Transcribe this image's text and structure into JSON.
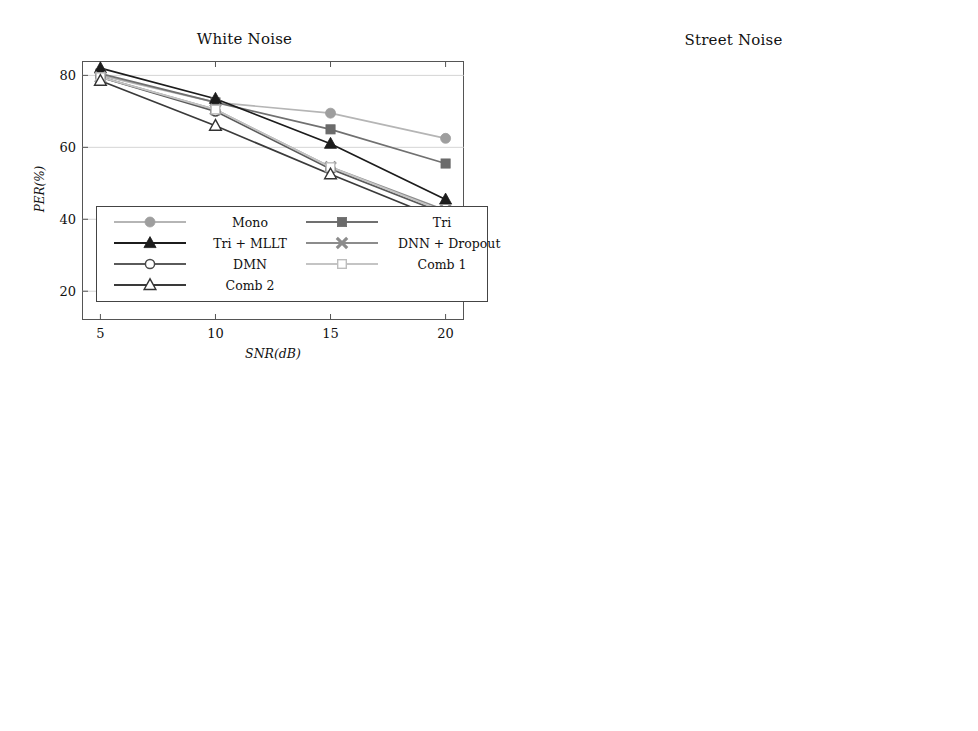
{
  "figure": {
    "xlabel": "SNR(dB)",
    "ylabel": "PER(%)",
    "x_values": [
      5,
      10,
      15,
      20
    ],
    "x_tick_labels": [
      "5",
      "10",
      "15",
      "20"
    ]
  },
  "legend": {
    "entries": [
      {
        "label": "Mono",
        "marker": "filled-circle",
        "color": "#9e9e9e",
        "line_color": "#b5b5b5"
      },
      {
        "label": "Tri",
        "marker": "filled-square",
        "color": "#6b6b6b",
        "line_color": "#707070"
      },
      {
        "label": "Tri + MLLT",
        "marker": "filled-triangle",
        "color": "#1c1c1c",
        "line_color": "#1c1c1c"
      },
      {
        "label": "DNN + Dropout",
        "marker": "cross-x",
        "color": "#8c8c8c",
        "line_color": "#8c8c8c"
      },
      {
        "label": "DMN",
        "marker": "open-circle",
        "color": "#4a4a4a",
        "line_color": "#5a5a5a"
      },
      {
        "label": "Comb 1",
        "marker": "open-square",
        "color": "#bdbdbd",
        "line_color": "#c4c4c4"
      },
      {
        "label": "Comb 2",
        "marker": "open-triangle",
        "color": "#333333",
        "line_color": "#3a3a3a"
      }
    ]
  },
  "chart_data": [
    {
      "type": "line",
      "title": "White Noise",
      "xlabel": "SNR(dB)",
      "ylabel": "PER(%)",
      "x": [
        5,
        10,
        15,
        20
      ],
      "xlim": [
        4.2,
        20.8
      ],
      "ylim": [
        12,
        84
      ],
      "yticks": [
        20,
        40,
        60,
        80
      ],
      "ytick_labels": [
        "20",
        "40",
        "60",
        "80"
      ],
      "grid": true,
      "legend_position": "lower-left-inside",
      "series": [
        {
          "name": "Mono",
          "values": [
            80.0,
            72.5,
            69.5,
            62.5
          ]
        },
        {
          "name": "Tri",
          "values": [
            80.5,
            72.5,
            65.0,
            55.5
          ]
        },
        {
          "name": "Tri + MLLT",
          "values": [
            82.0,
            73.5,
            61.0,
            45.5
          ]
        },
        {
          "name": "DNN + Dropout",
          "values": [
            79.5,
            70.5,
            54.5,
            42.5
          ]
        },
        {
          "name": "DMN",
          "values": [
            79.5,
            70.0,
            54.0,
            41.5
          ]
        },
        {
          "name": "Comb 1",
          "values": [
            79.5,
            70.5,
            54.5,
            42.0
          ]
        },
        {
          "name": "Comb 2",
          "values": [
            78.5,
            66.0,
            52.5,
            39.5
          ]
        }
      ]
    },
    {
      "type": "line",
      "title": "Street Noise",
      "xlabel": "SNR(dB)",
      "ylabel": "PER(%)",
      "x": [
        5,
        10,
        15,
        20
      ],
      "xlim": [
        4.2,
        20.8
      ],
      "ylim": [
        21,
        75
      ],
      "yticks": [
        40,
        60
      ],
      "ytick_labels": [
        "40",
        "60"
      ],
      "grid": true,
      "legend_position": "none",
      "series": [
        {
          "name": "Mono",
          "values": [
            73.0,
            68.5,
            56.5,
            45.5
          ]
        },
        {
          "name": "Tri",
          "values": [
            73.2,
            64.0,
            50.0,
            40.5
          ]
        },
        {
          "name": "Tri + MLLT",
          "values": [
            73.5,
            58.0,
            44.0,
            30.0
          ]
        },
        {
          "name": "DNN + Dropout",
          "values": [
            70.5,
            51.0,
            39.5,
            26.5
          ]
        },
        {
          "name": "DMN",
          "values": [
            70.0,
            50.0,
            37.5,
            25.5
          ]
        },
        {
          "name": "Comb 1",
          "values": [
            70.2,
            50.5,
            38.0,
            26.0
          ]
        },
        {
          "name": "Comb 2",
          "values": [
            67.5,
            47.5,
            35.5,
            22.5
          ]
        }
      ]
    },
    {
      "type": "line",
      "title": "Background Music",
      "xlabel": "SNR(dB)",
      "ylabel": "PER(%)",
      "x": [
        5,
        10,
        15,
        20
      ],
      "xlim": [
        4.2,
        20.8
      ],
      "ylim": [
        28,
        80
      ],
      "yticks": [
        40,
        60,
        80
      ],
      "ytick_labels": [
        "40",
        "60",
        "80"
      ],
      "grid": true,
      "legend_position": "none",
      "series": [
        {
          "name": "Mono",
          "values": [
            74.5,
            68.0,
            57.5,
            48.5
          ]
        },
        {
          "name": "Tri",
          "values": [
            74.5,
            64.0,
            52.5,
            42.5
          ]
        },
        {
          "name": "Tri + MLLT",
          "values": [
            74.0,
            63.0,
            50.0,
            38.0
          ]
        },
        {
          "name": "DNN + Dropout",
          "values": [
            73.5,
            60.5,
            46.5,
            37.5
          ]
        },
        {
          "name": "DMN",
          "values": [
            73.5,
            58.5,
            44.5,
            34.5
          ]
        },
        {
          "name": "Comb 1",
          "values": [
            73.5,
            59.0,
            45.5,
            36.0
          ]
        },
        {
          "name": "Comb 2",
          "values": [
            71.0,
            55.5,
            42.5,
            32.0
          ]
        }
      ]
    },
    {
      "type": "line",
      "title": "Interfering Speaker",
      "xlabel": "SNR(dB)",
      "ylabel": "PER(%)",
      "x": [
        5,
        10,
        15,
        20
      ],
      "xlim": [
        4.2,
        20.8
      ],
      "ylim": [
        27,
        68
      ],
      "yticks": [
        40,
        60
      ],
      "ytick_labels": [
        "40",
        "60"
      ],
      "grid": true,
      "legend_position": "none",
      "series": [
        {
          "name": "Mono",
          "values": [
            64.0,
            59.5,
            52.5,
            44.5
          ]
        },
        {
          "name": "Tri",
          "values": [
            65.0,
            56.0,
            47.0,
            38.5
          ]
        },
        {
          "name": "Tri + MLLT",
          "values": [
            64.5,
            54.5,
            42.0,
            33.5
          ]
        },
        {
          "name": "DNN + Dropout",
          "values": [
            63.0,
            51.0,
            41.0,
            33.0
          ]
        },
        {
          "name": "DMN",
          "values": [
            62.5,
            50.5,
            38.5,
            31.5
          ]
        },
        {
          "name": "Comb 1",
          "values": [
            62.0,
            51.0,
            37.5,
            30.5
          ]
        },
        {
          "name": "Comb 2",
          "values": [
            60.0,
            49.5,
            36.0,
            28.5
          ]
        }
      ]
    }
  ]
}
